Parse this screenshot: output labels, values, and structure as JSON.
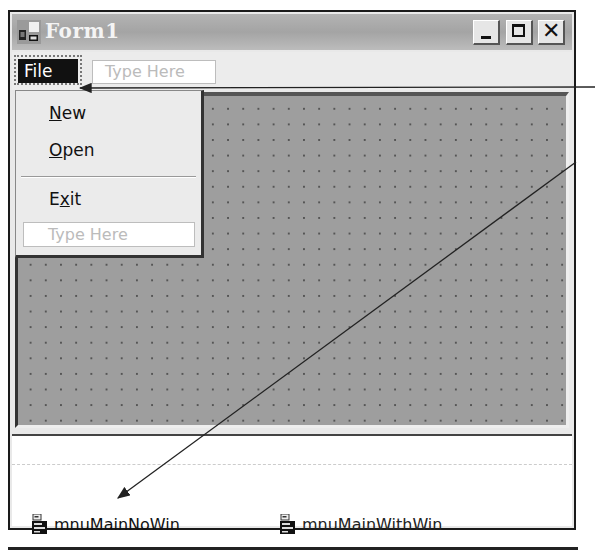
{
  "window": {
    "title": "Form1",
    "icon": "form-icon",
    "controls": {
      "minimize": "_",
      "maximize": "□",
      "close": "✕"
    }
  },
  "menubar": {
    "items": [
      {
        "label": "File",
        "selected": true
      },
      {
        "label": "Type Here",
        "placeholder": true
      }
    ]
  },
  "dropdown": {
    "items": [
      {
        "label": "New",
        "mnemonic": "N",
        "rest": "ew"
      },
      {
        "label": "Open",
        "mnemonic": "O",
        "rest": "pen"
      },
      {
        "label": "Exit",
        "pre": "E",
        "mnemonic": "x",
        "rest": "it"
      }
    ],
    "placeholder": "Type Here"
  },
  "component_tray": {
    "items": [
      {
        "name": "mnuMainNoWin",
        "icon": "main-menu-icon"
      },
      {
        "name": "mnuMainWithWin",
        "icon": "main-menu-icon"
      }
    ]
  },
  "colors": {
    "titlebar": "#a8a8a8",
    "client_grid": "#9e9e9e",
    "selected_menu": "#111111"
  }
}
